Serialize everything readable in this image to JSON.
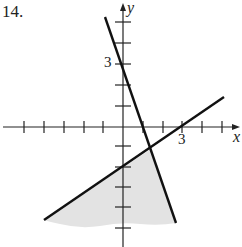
{
  "problem": {
    "number_label": "14."
  },
  "axes": {
    "x_label": "x",
    "y_label": "y",
    "x_tick_label": "3",
    "y_tick_label": "3",
    "x_range": [
      -6,
      6
    ],
    "y_range": [
      -5,
      6
    ]
  },
  "lines": [
    {
      "name": "steep-line",
      "x_intercept": 1,
      "y_intercept": 3,
      "equation": "y = -3x + 3"
    },
    {
      "name": "shallow-line",
      "x_intercept": 3,
      "y_intercept": -2,
      "equation": "y = (2/3)x - 2"
    }
  ],
  "shaded_region": {
    "description": "region below both lines",
    "fill": "#e3e3e3"
  },
  "colors": {
    "line": "#111111",
    "axis": "#222222",
    "shade": "#e3e3e3"
  }
}
